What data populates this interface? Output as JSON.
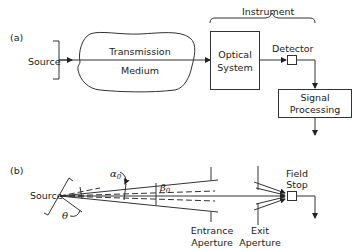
{
  "diagram": {
    "part_a": {
      "label": "(a)",
      "source": "Source",
      "medium_line1": "Transmission",
      "medium_line2": "Medium",
      "instrument": "Instrument",
      "optical_line1": "Optical",
      "optical_line2": "System",
      "detector": "Detector",
      "signal_line1": "Signal",
      "signal_line2": "Processing"
    },
    "part_b": {
      "label": "(b)",
      "source": "Source",
      "alpha": "α",
      "alpha_sub": "0",
      "beta": "β",
      "beta_sub": "0",
      "theta": "θ",
      "entrance_line1": "Entrance",
      "entrance_line2": "Aperture",
      "exit_line1": "Exit",
      "exit_line2": "Aperture",
      "field_line1": "Field",
      "field_line2": "Stop"
    }
  }
}
